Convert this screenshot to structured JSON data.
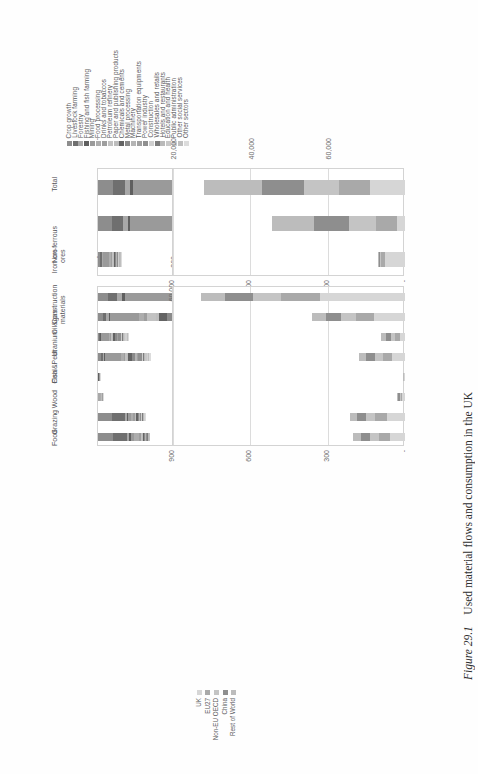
{
  "figure": {
    "number_label": "Figure 29.1",
    "caption": "Used material flows and consumption in the UK"
  },
  "legends": {
    "sectors": {
      "name": "sector-legend",
      "items": [
        {
          "label": "Crop growth",
          "color": "#8d8d8d"
        },
        {
          "label": "Livestock farming",
          "color": "#6f6f6f"
        },
        {
          "label": "Forestry",
          "color": "#a8a8a8"
        },
        {
          "label": "Fishing and fish farming",
          "color": "#5f5f5f"
        },
        {
          "label": "Mining",
          "color": "#9a9a9a"
        },
        {
          "label": "Food processing",
          "color": "#adadad"
        },
        {
          "label": "Drinks and tobaccos",
          "color": "#9e9e9e"
        },
        {
          "label": "Petroleum refinery",
          "color": "#c2c2c2"
        },
        {
          "label": "Paper and publishing products",
          "color": "#bdbdbd"
        },
        {
          "label": "Chemicals and cements",
          "color": "#636363"
        },
        {
          "label": "Metal processing",
          "color": "#8a8a8a"
        },
        {
          "label": "Machinery",
          "color": "#b4b4b4"
        },
        {
          "label": "Transportation equipments",
          "color": "#a0a0a0"
        },
        {
          "label": "Power industry",
          "color": "#8f8f8f"
        },
        {
          "label": "Construction",
          "color": "#cfcfcf"
        },
        {
          "label": "Wholesales and retails",
          "color": "#7c7c7c"
        },
        {
          "label": "Hotels and restaurants",
          "color": "#b9b9b9"
        },
        {
          "label": "Education and health",
          "color": "#c8c8c8"
        },
        {
          "label": "Public administration",
          "color": "#d2d2d2"
        },
        {
          "label": "Other social services",
          "color": "#bfbfbf"
        },
        {
          "label": "Other sectors",
          "color": "#dcdcdc"
        }
      ]
    },
    "regions": {
      "name": "region-legend",
      "items": [
        {
          "label": "UK",
          "color": "#d6d6d6"
        },
        {
          "label": "EU27",
          "color": "#a9a9a9"
        },
        {
          "label": "Non-EU OECD",
          "color": "#c4c4c4"
        },
        {
          "label": "China",
          "color": "#8e8e8e"
        },
        {
          "label": "Rest of World",
          "color": "#bcbcbc"
        }
      ]
    }
  },
  "chart_data": [
    {
      "id": "panel-top-left",
      "type": "bar",
      "orientation": "vertical",
      "stacked": true,
      "title": "",
      "xlabel": "",
      "ylabel": "",
      "categories": [
        "Total",
        "Non-ferrous ores",
        "Iron ore"
      ],
      "axis_ticks": [
        "-",
        "20,000",
        "40,000",
        "60,000"
      ],
      "ylim": [
        0,
        60000
      ],
      "grid": true,
      "legend": "sectors",
      "series": [
        {
          "name": "Crop growth",
          "values": [
            4200,
            3900,
            520
          ]
        },
        {
          "name": "Livestock farming",
          "values": [
            3100,
            3000,
            340
          ]
        },
        {
          "name": "Forestry",
          "values": [
            1500,
            1300,
            180
          ]
        },
        {
          "name": "Fishing and fish farming",
          "values": [
            900,
            700,
            90
          ]
        },
        {
          "name": "Mining",
          "values": [
            14500,
            13800,
            1500
          ]
        },
        {
          "name": "Food processing",
          "values": [
            5200,
            4200,
            420
          ]
        },
        {
          "name": "Drinks and tobaccos",
          "values": [
            2600,
            2100,
            210
          ]
        },
        {
          "name": "Petroleum refinery",
          "values": [
            1800,
            1500,
            160
          ]
        },
        {
          "name": "Paper and publishing products",
          "values": [
            1700,
            1400,
            150
          ]
        },
        {
          "name": "Chemicals and cements",
          "values": [
            4100,
            3400,
            380
          ]
        },
        {
          "name": "Metal processing",
          "values": [
            3000,
            2500,
            300
          ]
        },
        {
          "name": "Machinery",
          "values": [
            1400,
            1100,
            120
          ]
        },
        {
          "name": "Transportation equipments",
          "values": [
            1300,
            1000,
            110
          ]
        },
        {
          "name": "Power industry",
          "values": [
            2200,
            1800,
            200
          ]
        },
        {
          "name": "Construction",
          "values": [
            1900,
            1500,
            170
          ]
        },
        {
          "name": "Wholesales and retails",
          "values": [
            1100,
            900,
            100
          ]
        },
        {
          "name": "Hotels and restaurants",
          "values": [
            900,
            700,
            80
          ]
        },
        {
          "name": "Education and health",
          "values": [
            800,
            600,
            70
          ]
        },
        {
          "name": "Public administration",
          "values": [
            700,
            500,
            60
          ]
        },
        {
          "name": "Other social services",
          "values": [
            600,
            450,
            50
          ]
        },
        {
          "name": "Other sectors",
          "values": [
            1400,
            1000,
            110
          ]
        }
      ],
      "totals": [
        52000,
        44500,
        6000
      ]
    },
    {
      "id": "panel-top-right",
      "type": "bar",
      "orientation": "vertical",
      "stacked": true,
      "title": "",
      "xlabel": "",
      "ylabel": "",
      "categories": [
        "Construction materials",
        "Oil&gas",
        "Uranium",
        "Coal&Peat",
        "Fish",
        "Wood",
        "Grazing",
        "Food"
      ],
      "axis_ticks": [
        "-",
        "300",
        "600",
        "900"
      ],
      "ylim": [
        0,
        900
      ],
      "grid": true,
      "legend": "sectors",
      "totals": [
        855,
        470,
        120,
        205,
        8,
        22,
        185,
        200
      ],
      "series": [
        {
          "name": "Crop growth",
          "values": [
            40,
            20,
            4,
            10,
            0,
            1,
            55,
            60
          ]
        },
        {
          "name": "Livestock farming",
          "values": [
            35,
            15,
            3,
            8,
            0,
            1,
            50,
            52
          ]
        },
        {
          "name": "Forestry",
          "values": [
            20,
            10,
            2,
            6,
            0,
            6,
            8,
            9
          ]
        },
        {
          "name": "Fishing and fish farming",
          "values": [
            10,
            5,
            1,
            3,
            5,
            0,
            2,
            6
          ]
        },
        {
          "name": "Mining",
          "values": [
            260,
            120,
            32,
            62,
            1,
            2,
            12,
            14
          ]
        },
        {
          "name": "Food processing",
          "values": [
            45,
            22,
            6,
            12,
            1,
            1,
            10,
            18
          ]
        },
        {
          "name": "Drinks and tobaccos",
          "values": [
            22,
            12,
            3,
            6,
            0,
            1,
            5,
            7
          ]
        },
        {
          "name": "Petroleum refinery",
          "values": [
            18,
            36,
            3,
            6,
            0,
            1,
            3,
            4
          ]
        },
        {
          "name": "Paper and publishing products",
          "values": [
            20,
            10,
            3,
            5,
            0,
            2,
            3,
            4
          ]
        },
        {
          "name": "Chemicals and cements",
          "values": [
            75,
            35,
            9,
            16,
            0,
            1,
            6,
            5
          ]
        },
        {
          "name": "Metal processing",
          "values": [
            55,
            26,
            7,
            12,
            0,
            1,
            5,
            4
          ]
        },
        {
          "name": "Machinery",
          "values": [
            24,
            12,
            3,
            5,
            0,
            1,
            3,
            2
          ]
        },
        {
          "name": "Transportation equipments",
          "values": [
            22,
            11,
            3,
            5,
            0,
            1,
            2,
            2
          ]
        },
        {
          "name": "Power industry",
          "values": [
            40,
            20,
            12,
            14,
            0,
            1,
            3,
            3
          ]
        },
        {
          "name": "Construction",
          "values": [
            90,
            18,
            4,
            7,
            0,
            1,
            3,
            2
          ]
        },
        {
          "name": "Wholesales and retails",
          "values": [
            18,
            9,
            3,
            4,
            0,
            0,
            4,
            3
          ]
        },
        {
          "name": "Hotels and restaurants",
          "values": [
            15,
            8,
            2,
            4,
            0,
            0,
            4,
            2
          ]
        },
        {
          "name": "Education and health",
          "values": [
            14,
            30,
            7,
            5,
            0,
            0,
            3,
            1
          ]
        },
        {
          "name": "Public administration",
          "values": [
            12,
            20,
            5,
            5,
            0,
            0,
            2,
            1
          ]
        },
        {
          "name": "Other social services",
          "values": [
            10,
            15,
            4,
            4,
            0,
            1,
            1,
            1
          ]
        },
        {
          "name": "Other sectors",
          "values": [
            10,
            46,
            4,
            6,
            1,
            1,
            1,
            0
          ]
        }
      ]
    },
    {
      "id": "panel-bottom-left",
      "type": "bar",
      "orientation": "vertical-down",
      "stacked": true,
      "title": "",
      "xlabel": "",
      "ylabel": "",
      "categories": [
        "Total",
        "Non-ferrous ores",
        "Iron ore"
      ],
      "axis_ticks": [
        "-",
        "20,000",
        "40,000",
        "60,000"
      ],
      "ylim": [
        0,
        60000
      ],
      "grid": true,
      "legend": "regions",
      "totals": [
        52000,
        34500,
        7000
      ],
      "series": [
        {
          "name": "UK",
          "values": [
            9000,
            2000,
            5200
          ]
        },
        {
          "name": "EU27",
          "values": [
            8000,
            5500,
            900
          ]
        },
        {
          "name": "Non-EU OECD",
          "values": [
            9000,
            7000,
            400
          ]
        },
        {
          "name": "China",
          "values": [
            11000,
            9000,
            300
          ]
        },
        {
          "name": "Rest of World",
          "values": [
            15000,
            11000,
            200
          ]
        }
      ]
    },
    {
      "id": "panel-bottom-right",
      "type": "bar",
      "orientation": "vertical-down",
      "stacked": true,
      "title": "",
      "xlabel": "",
      "ylabel": "",
      "categories": [
        "Construction materials",
        "Oil&gas",
        "Uranium",
        "Coal&Peat",
        "Fish",
        "Wood",
        "Grazing",
        "Food"
      ],
      "axis_ticks": [
        "-",
        "300",
        "600",
        "900"
      ],
      "ylim": [
        0,
        900
      ],
      "grid": true,
      "legend": "regions",
      "totals": [
        790,
        360,
        95,
        180,
        6,
        30,
        215,
        200
      ],
      "series": [
        {
          "name": "UK",
          "values": [
            330,
            120,
            20,
            50,
            2,
            10,
            70,
            60
          ]
        },
        {
          "name": "EU27",
          "values": [
            150,
            70,
            18,
            35,
            1,
            6,
            45,
            40
          ]
        },
        {
          "name": "Non-EU OECD",
          "values": [
            110,
            60,
            17,
            30,
            1,
            5,
            35,
            35
          ]
        },
        {
          "name": "China",
          "values": [
            110,
            55,
            20,
            35,
            1,
            5,
            35,
            35
          ]
        },
        {
          "name": "Rest of World",
          "values": [
            90,
            55,
            20,
            30,
            1,
            4,
            30,
            30
          ]
        }
      ]
    }
  ]
}
